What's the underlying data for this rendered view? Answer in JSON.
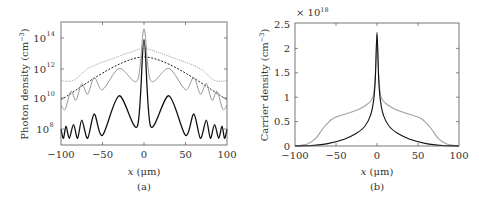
{
  "chart_data": [
    {
      "panel": "(a)",
      "type": "line",
      "title": "",
      "xlabel": "x (μm)",
      "ylabel": "Photon density (cm⁻³)",
      "yscale": "log",
      "xlim": [
        -100,
        100
      ],
      "ylim": [
        10000000.0,
        1000000000000000.0
      ],
      "xticks": [
        "−100",
        "−50",
        "0",
        "50",
        "100"
      ],
      "yticks": [
        "10^8",
        "10^10",
        "10^12",
        "10^14"
      ],
      "grid": false,
      "legend": null,
      "series": [
        {
          "name": "light gray dotted",
          "style": "dotted",
          "color": "#aaaaaa",
          "x": [
            -100,
            -85,
            -70,
            -55,
            -40,
            -20,
            0,
            20,
            40,
            55,
            70,
            85,
            100
          ],
          "log10_y": [
            11.2,
            11.2,
            11.9,
            12.3,
            12.6,
            13.0,
            13.3,
            13.0,
            12.6,
            12.3,
            11.9,
            11.2,
            11.2
          ]
        },
        {
          "name": "black dashed",
          "style": "dashed",
          "color": "#222222",
          "x": [
            -100,
            0,
            100
          ],
          "log10_y": [
            9.95,
            12.75,
            9.95
          ]
        },
        {
          "name": "gray solid",
          "style": "solid",
          "color": "#999999",
          "x": [
            -100,
            -95,
            -88,
            -82,
            -75,
            -68,
            -60,
            -50,
            -30,
            -8,
            0,
            8,
            30,
            50,
            60,
            68,
            75,
            82,
            88,
            95,
            100
          ],
          "log10_y": [
            9.6,
            9.3,
            10.5,
            9.9,
            11.0,
            10.3,
            11.4,
            10.6,
            12.0,
            11.2,
            14.6,
            11.2,
            12.0,
            10.6,
            11.4,
            10.3,
            11.0,
            9.9,
            10.5,
            9.3,
            9.6
          ]
        },
        {
          "name": "black solid",
          "style": "solid",
          "color": "#111111",
          "x": [
            -100,
            -97,
            -94,
            -90,
            -85,
            -80,
            -75,
            -68,
            -60,
            -50,
            -30,
            -8,
            0,
            8,
            30,
            50,
            60,
            68,
            75,
            80,
            85,
            90,
            94,
            97,
            100
          ],
          "log10_y": [
            8.0,
            7.4,
            8.2,
            7.4,
            8.3,
            7.4,
            8.6,
            7.4,
            9.0,
            7.6,
            10.2,
            8.2,
            13.9,
            8.2,
            10.2,
            7.6,
            9.0,
            7.4,
            8.6,
            7.4,
            8.3,
            7.4,
            8.2,
            7.4,
            8.0
          ]
        }
      ]
    },
    {
      "panel": "(b)",
      "type": "line",
      "title": "",
      "xlabel": "x (μm)",
      "ylabel": "Carrier density (cm⁻³)",
      "multiplier": "×10^18",
      "xlim": [
        -100,
        100
      ],
      "ylim": [
        0,
        2.5
      ],
      "xticks": [
        "−100",
        "−50",
        "0",
        "50",
        "100"
      ],
      "yticks": [
        "0",
        "0.5",
        "1",
        "1.5",
        "2",
        "2.5"
      ],
      "grid": false,
      "legend": null,
      "series": [
        {
          "name": "gray",
          "color": "#a0a0a0",
          "x": [
            -100,
            -85,
            -75,
            -65,
            -55,
            -45,
            -30,
            -15,
            -5,
            -2,
            0,
            2,
            5,
            15,
            30,
            45,
            55,
            65,
            75,
            85,
            100
          ],
          "y": [
            0.0,
            0.04,
            0.15,
            0.38,
            0.55,
            0.62,
            0.7,
            0.82,
            1.0,
            1.5,
            2.3,
            1.5,
            1.0,
            0.82,
            0.7,
            0.62,
            0.55,
            0.38,
            0.15,
            0.04,
            0.0
          ]
        },
        {
          "name": "black",
          "color": "#111111",
          "x": [
            -100,
            -80,
            -60,
            -40,
            -25,
            -15,
            -8,
            -4,
            -2,
            0,
            2,
            4,
            8,
            15,
            25,
            40,
            60,
            80,
            100
          ],
          "y": [
            0.0,
            0.01,
            0.05,
            0.14,
            0.26,
            0.4,
            0.62,
            0.95,
            1.4,
            2.33,
            1.4,
            0.95,
            0.62,
            0.4,
            0.26,
            0.14,
            0.05,
            0.01,
            0.0
          ]
        }
      ]
    }
  ],
  "panels": {
    "a": {
      "ylabel": "Photon density (cm",
      "ylabel_sup": "−3",
      "ylabel_close": ")",
      "xlabel_var": "x",
      "xlabel_unit": " (μm)",
      "caption": "(a)",
      "xticks": [
        "−100",
        "−50",
        "0",
        "50",
        "100"
      ],
      "yticks_base": [
        "10",
        "10",
        "10",
        "10"
      ],
      "yticks_exp": [
        "14",
        "12",
        "10",
        "8"
      ]
    },
    "b": {
      "ylabel": "Carrier density (cm",
      "ylabel_sup": "−3",
      "ylabel_close": ")",
      "xlabel_var": "x",
      "xlabel_unit": " (μm)",
      "caption": "(b)",
      "multiplier_base": "× 10",
      "multiplier_exp": "18",
      "xticks": [
        "−100",
        "−50",
        "0",
        "50",
        "100"
      ],
      "yticks": [
        "2.5",
        "2",
        "1.5",
        "1",
        "0.5",
        "0"
      ]
    }
  }
}
